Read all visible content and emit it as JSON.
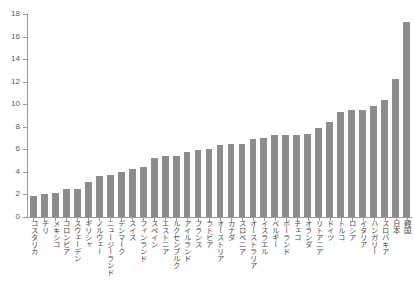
{
  "chart_data": {
    "type": "bar",
    "title": "",
    "subtitle": "",
    "xlabel": "",
    "ylabel": "",
    "ylim": [
      0,
      18
    ],
    "ytick_values": [
      0,
      2,
      4,
      6,
      8,
      10,
      12,
      14,
      16,
      18
    ],
    "ytick_labels": [
      "0",
      "2",
      "4",
      "6",
      "8",
      "10",
      "12",
      "14",
      "16",
      "18"
    ],
    "grid": false,
    "legend": null,
    "bar_color": "#8c8c8c",
    "axis_color": "#9a9a9a",
    "text_color": "#4a4a4a",
    "categories": [
      "コスタリカ",
      "チリ",
      "メキシコ",
      "コロンビア",
      "スウェーデン",
      "ギリシャ",
      "ノルウェー",
      "ニュージーランド",
      "デンマーク",
      "スイス",
      "フィンランド",
      "スペイン",
      "エストニア",
      "ルクセンブルク",
      "アイルランド",
      "フランス",
      "ラトビア",
      "オーストリア",
      "カナダ",
      "スロベニア",
      "オーストラリア",
      "イスラエル",
      "ベルギー",
      "ポーランド",
      "チェコ",
      "オランダ",
      "リトアニア",
      "ドイツ",
      "トルコ",
      "ロシア",
      "イタリア",
      "ハンガリー",
      "スロバキア",
      "日本",
      "韓国"
    ],
    "values": [
      1.9,
      2.0,
      2.1,
      2.5,
      2.5,
      3.1,
      3.6,
      3.75,
      4.0,
      4.25,
      4.4,
      5.2,
      5.4,
      5.4,
      5.75,
      5.9,
      6.05,
      6.4,
      6.45,
      6.5,
      6.9,
      7.0,
      7.3,
      7.3,
      7.3,
      7.35,
      7.9,
      8.4,
      9.3,
      9.5,
      9.5,
      9.8,
      10.4,
      12.2,
      17.3
    ]
  }
}
